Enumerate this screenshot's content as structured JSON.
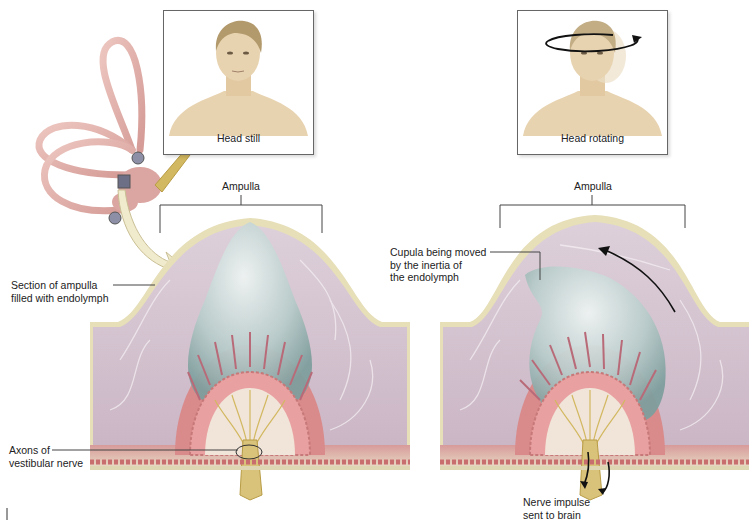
{
  "figure": {
    "left_panel": {
      "portrait_caption": "Head still",
      "ampulla_label": "Ampulla",
      "callouts": [
        {
          "id": "section-of-ampulla",
          "text": "Section of ampulla\nfilled with endolymph"
        },
        {
          "id": "axons-vestibular-nerve",
          "text": "Axons of\nvestibular nerve"
        }
      ]
    },
    "right_panel": {
      "portrait_caption": "Head rotating",
      "ampulla_label": "Ampulla",
      "callouts": [
        {
          "id": "cupula-moved",
          "text": "Cupula being moved\nby the inertia of\nthe endolymph"
        },
        {
          "id": "nerve-impulse",
          "text": "Nerve impulse\nsent to brain"
        }
      ]
    },
    "colors": {
      "endolymph": "#cdb8c6",
      "cupula": "#b9cccb",
      "wall": "#e6dfb8",
      "hair_cells": "#d98a8a",
      "nerve": "#d9c27a",
      "semicircular_canals": "#e3b3ad",
      "skin": "#e8d3b0"
    }
  }
}
